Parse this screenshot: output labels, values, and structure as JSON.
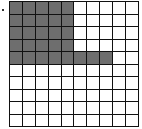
{
  "figure": {
    "type": "hundred-grid",
    "rows": 10,
    "cols": 10,
    "shaded_per_row": [
      5,
      5,
      5,
      5,
      8,
      0,
      0,
      0,
      0,
      0
    ],
    "shaded_total": 28,
    "total_cells": 100,
    "colors": {
      "shaded": "#6e6e6e",
      "empty": "#ffffff",
      "lines": "#111111"
    }
  }
}
